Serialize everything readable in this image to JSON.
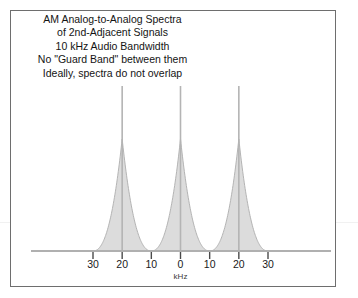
{
  "figure": {
    "title_lines": [
      "AM Analog-to-Analog Spectra",
      "of 2nd-Adjacent Signals",
      "10 kHz Audio Bandwidth",
      "No \"Guard Band\" between them",
      "Ideally, spectra do not overlap"
    ],
    "colors": {
      "border": "#6e6e6e",
      "spectrum_fill": "#dcdcdc",
      "spectrum_stroke": "#b4b4b4",
      "axis_line": "#b0b0b0",
      "tick": "#4a4a4a",
      "text": "#141414",
      "background": "#ffffff",
      "faint_rule": "#f1f1f1"
    }
  },
  "chart_data": {
    "type": "area",
    "title": "AM Analog-to-Analog Spectra of 2nd-Adjacent Signals",
    "xlabel": "kHz",
    "ylabel": "",
    "xlim": [
      -30,
      30
    ],
    "ylim": [
      0,
      1
    ],
    "grid": false,
    "legend": null,
    "tick_values": [
      -30,
      -20,
      -10,
      0,
      10,
      20,
      30
    ],
    "tick_labels": [
      "30",
      "20",
      "10",
      "0",
      "10",
      "20",
      "30"
    ],
    "axis_unit_label": "kHz",
    "series": [
      {
        "name": "Lower 2nd-adjacent signal",
        "carrier_khz": -20,
        "audio_bandwidth_khz": 10,
        "occupied_band_khz": [
          -30,
          -10
        ],
        "carrier_spike": true
      },
      {
        "name": "Desired signal",
        "carrier_khz": 0,
        "audio_bandwidth_khz": 10,
        "occupied_band_khz": [
          -10,
          10
        ],
        "carrier_spike": true
      },
      {
        "name": "Upper 2nd-adjacent signal",
        "carrier_khz": 20,
        "audio_bandwidth_khz": 10,
        "occupied_band_khz": [
          10,
          30
        ],
        "carrier_spike": true
      }
    ],
    "annotations": [
      "10 kHz Audio Bandwidth",
      "No \"Guard Band\" between them",
      "Ideally, spectra do not overlap"
    ]
  }
}
